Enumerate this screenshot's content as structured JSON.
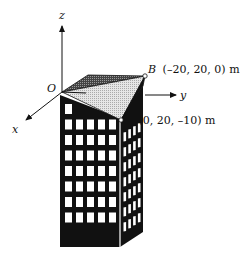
{
  "axes": {
    "origin_label": "O",
    "x_label": "x",
    "y_label": "y",
    "z_label": "z"
  },
  "points": {
    "A": {
      "name": "A",
      "coords": "(0, 20, –10) m"
    },
    "B": {
      "name": "B",
      "coords": "(–20, 20, 0) m"
    }
  },
  "building": {
    "front_columns": 5,
    "front_rows": 8,
    "side_columns": 4,
    "side_rows": 7
  },
  "colors": {
    "ink": "#111111",
    "roof_dark": "#555555",
    "roof_light": "#d6d6d6",
    "window": "#ffffff"
  }
}
